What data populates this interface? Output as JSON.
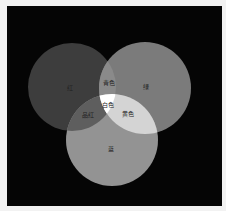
{
  "diagram": {
    "type": "venn",
    "title": "",
    "background": "#050505",
    "frame": "#f2f2f2",
    "circles": [
      {
        "id": "red",
        "label": "红",
        "cx": 72,
        "cy": 87,
        "r": 44,
        "fill": "#3a3a3a"
      },
      {
        "id": "green",
        "label": "绿",
        "cx": 145,
        "cy": 88,
        "r": 46,
        "fill": "#7a7a7a"
      },
      {
        "id": "blue",
        "label": "蓝",
        "cx": 112,
        "cy": 140,
        "r": 46,
        "fill": "#8f8f8f"
      }
    ],
    "intersections": [
      {
        "id": "red-green",
        "label": "青色",
        "x": 109,
        "y": 83
      },
      {
        "id": "red-blue",
        "label": "品红",
        "x": 88,
        "y": 115
      },
      {
        "id": "green-blue",
        "label": "黄色",
        "x": 128,
        "y": 114
      },
      {
        "id": "red-green-blue",
        "label": "白色",
        "x": 108,
        "y": 105
      }
    ],
    "label_positions": {
      "red": {
        "x": 70,
        "y": 88
      },
      "green": {
        "x": 146,
        "y": 87
      },
      "blue": {
        "x": 111,
        "y": 149
      }
    }
  }
}
